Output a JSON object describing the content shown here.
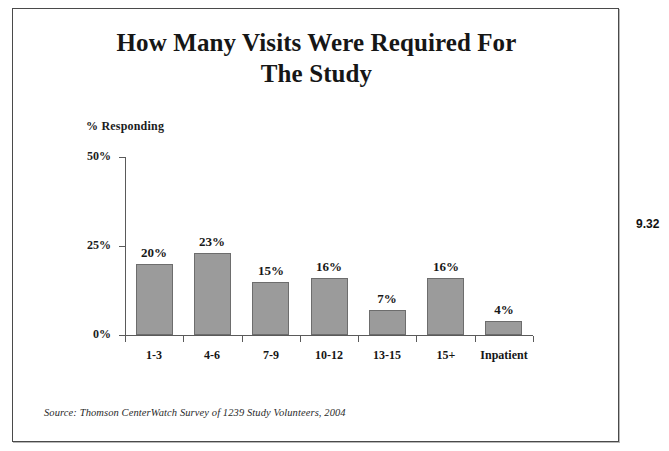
{
  "chart_data": {
    "type": "bar",
    "title": "How Many Visits Were Required For The Study",
    "title_line1": "How Many Visits Were Required For",
    "title_line2": "The Study",
    "xlabel": "",
    "ylabel": "% Responding",
    "categories": [
      "1-3",
      "4-6",
      "7-9",
      "10-12",
      "13-15",
      "15+",
      "Inpatient"
    ],
    "values": [
      20,
      23,
      15,
      16,
      7,
      16,
      4
    ],
    "value_labels": [
      "20%",
      "23%",
      "15%",
      "16%",
      "7%",
      "16%",
      "4%"
    ],
    "ylim": [
      0,
      50
    ],
    "ytick_values": [
      0,
      25,
      50
    ],
    "ytick_labels": [
      "0%",
      "25%",
      "50%"
    ],
    "grid": false,
    "legend": false,
    "bar_color": "#9b9b9b",
    "bar_border_color": "#6d6d6d",
    "axis_color": "#5a5a5a",
    "text_color": "#161616"
  },
  "source": {
    "note": "Source: Thomson CenterWatch Survey of 1239 Study Volunteers, 2004"
  },
  "page": {
    "marginal_number": "9.32"
  }
}
